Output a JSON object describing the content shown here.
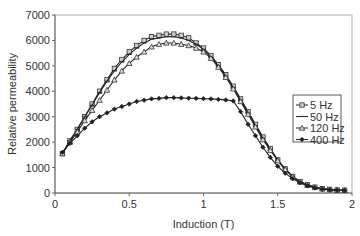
{
  "chart_data": {
    "type": "line",
    "title": "",
    "xlabel": "Induction (T)",
    "ylabel": "Relative permeability",
    "xlim": [
      0,
      2
    ],
    "ylim": [
      0,
      7000
    ],
    "xticks": [
      0,
      0.5,
      1,
      1.5,
      2
    ],
    "xtick_labels": [
      "0",
      "0.5",
      "1",
      "1.5",
      "2"
    ],
    "yticks": [
      0,
      1000,
      2000,
      3000,
      4000,
      5000,
      6000,
      7000
    ],
    "ytick_labels": [
      "0",
      "1000",
      "2000",
      "3000",
      "4000",
      "5000",
      "6000",
      "7000"
    ],
    "grid": false,
    "legend_position": "right-center inside",
    "x": [
      0.05,
      0.1,
      0.15,
      0.2,
      0.25,
      0.3,
      0.35,
      0.4,
      0.45,
      0.5,
      0.55,
      0.6,
      0.65,
      0.7,
      0.75,
      0.8,
      0.85,
      0.9,
      0.95,
      1.0,
      1.05,
      1.1,
      1.15,
      1.2,
      1.25,
      1.3,
      1.35,
      1.4,
      1.45,
      1.5,
      1.55,
      1.6,
      1.65,
      1.7,
      1.75,
      1.8,
      1.85,
      1.9,
      1.95
    ],
    "series": [
      {
        "name": "5 Hz",
        "marker": "square",
        "values": [
          1550,
          2050,
          2500,
          3000,
          3500,
          4000,
          4450,
          4900,
          5250,
          5550,
          5800,
          6000,
          6150,
          6200,
          6250,
          6250,
          6200,
          6100,
          5900,
          5700,
          5400,
          5050,
          4650,
          4200,
          3700,
          3200,
          2700,
          2200,
          1750,
          1300,
          950,
          650,
          450,
          320,
          230,
          170,
          140,
          120,
          110
        ]
      },
      {
        "name": "50 Hz",
        "marker": "dash",
        "values": [
          1550,
          2050,
          2500,
          3000,
          3450,
          3950,
          4400,
          4800,
          5150,
          5450,
          5700,
          5900,
          6050,
          6100,
          6150,
          6150,
          6100,
          6000,
          5850,
          5650,
          5350,
          5000,
          4600,
          4150,
          3650,
          3150,
          2650,
          2150,
          1700,
          1280,
          940,
          640,
          440,
          310,
          220,
          165,
          135,
          115,
          105
        ]
      },
      {
        "name": "120 Hz",
        "marker": "triangle",
        "values": [
          1550,
          2000,
          2400,
          2850,
          3250,
          3650,
          4050,
          4450,
          4800,
          5100,
          5350,
          5550,
          5750,
          5850,
          5900,
          5900,
          5850,
          5800,
          5700,
          5550,
          5300,
          4950,
          4550,
          4100,
          3600,
          3100,
          2600,
          2100,
          1680,
          1270,
          930,
          640,
          440,
          310,
          220,
          165,
          135,
          115,
          105
        ]
      },
      {
        "name": "400 Hz",
        "marker": "diamond",
        "values": [
          1600,
          1950,
          2250,
          2550,
          2800,
          3000,
          3150,
          3300,
          3400,
          3500,
          3600,
          3650,
          3700,
          3720,
          3750,
          3750,
          3740,
          3730,
          3720,
          3710,
          3700,
          3680,
          3660,
          3620,
          3200,
          2700,
          2250,
          1800,
          1400,
          1050,
          780,
          560,
          400,
          280,
          200,
          150,
          120,
          105,
          95
        ]
      }
    ]
  }
}
